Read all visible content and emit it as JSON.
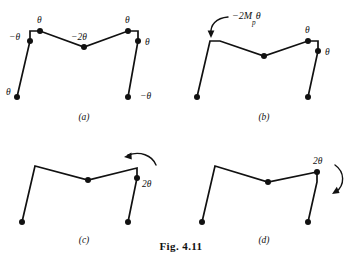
{
  "figure": {
    "caption": "Fig. 4.11",
    "panels": [
      {
        "id": "a",
        "label": "(a)",
        "labels": [
          {
            "name": "left-base-rotation",
            "text": "θ"
          },
          {
            "name": "left-knee-rotation",
            "text": "−θ"
          },
          {
            "name": "left-top-rotation",
            "text": "θ"
          },
          {
            "name": "apex-rotation",
            "text": "−2θ"
          },
          {
            "name": "right-top-rotation",
            "text": "θ"
          },
          {
            "name": "right-knee-rotation",
            "text": "θ"
          },
          {
            "name": "right-base-rotation",
            "text": "−θ"
          }
        ]
      },
      {
        "id": "b",
        "label": "(b)",
        "labels": [
          {
            "name": "applied-moment",
            "text": "−2M",
            "sub": "p",
            "tail": "θ"
          },
          {
            "name": "right-top-rotation",
            "text": "θ"
          },
          {
            "name": "right-knee-rotation",
            "text": "θ"
          }
        ]
      },
      {
        "id": "c",
        "label": "(c)",
        "labels": [
          {
            "name": "right-knee-rotation",
            "text": "2θ"
          }
        ]
      },
      {
        "id": "d",
        "label": "(d)",
        "labels": [
          {
            "name": "right-top-rotation",
            "text": "2θ"
          }
        ]
      }
    ]
  }
}
